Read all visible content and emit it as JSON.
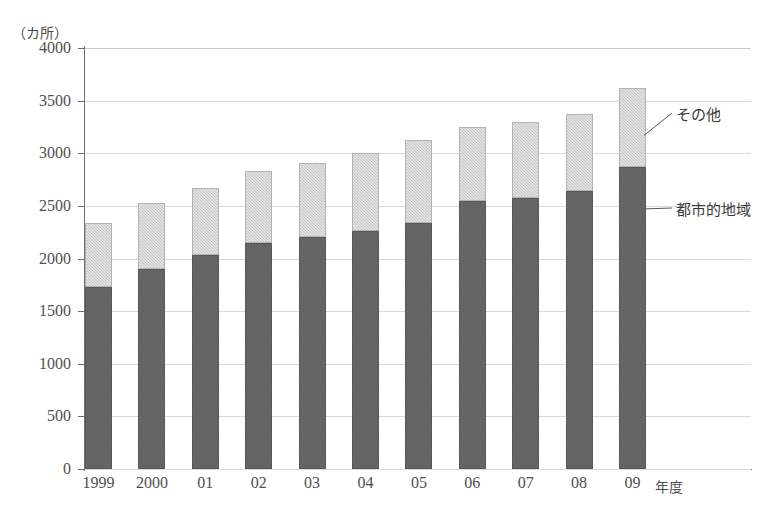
{
  "chart_data": {
    "type": "bar",
    "stacked": true,
    "title": "",
    "subtitle": "",
    "unit_label": "（カ所）",
    "xlabel": "年度",
    "ylabel": "",
    "ylim": [
      0,
      4000
    ],
    "ytick_step": 500,
    "yticks": [
      "4000",
      "3500",
      "3000",
      "2500",
      "2000",
      "1500",
      "1000",
      "500",
      "0"
    ],
    "grid": true,
    "legend_position": "callout-right",
    "categories": [
      "1999",
      "2000",
      "01",
      "02",
      "03",
      "04",
      "05",
      "06",
      "07",
      "08",
      "09"
    ],
    "series": [
      {
        "name": "都市的地域",
        "color": "#616161",
        "values": [
          1725,
          1900,
          2030,
          2150,
          2200,
          2265,
          2340,
          2550,
          2575,
          2640,
          2870
        ]
      },
      {
        "name": "その他",
        "color": "#cfcfcf",
        "values": [
          610,
          630,
          640,
          680,
          705,
          740,
          785,
          695,
          725,
          735,
          750
        ]
      }
    ],
    "totals": [
      2335,
      2530,
      2670,
      2830,
      2905,
      3005,
      3125,
      3245,
      3300,
      3375,
      3620
    ],
    "annotations": [
      {
        "label": "その他",
        "target_series": "その他"
      },
      {
        "label": "都市的地域",
        "target_series": "都市的地域"
      }
    ]
  },
  "axis": {
    "unit_caption": "（カ所）",
    "x_unit_caption": "年度"
  }
}
